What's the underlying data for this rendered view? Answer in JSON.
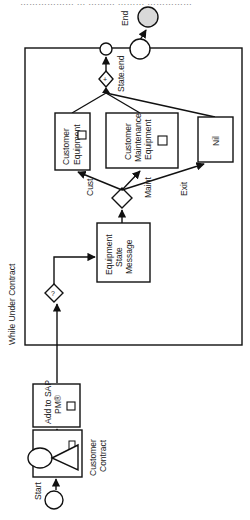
{
  "header_cut_text": "……………… … ……… ……… ……………",
  "loop": {
    "label": "While Under Contract"
  },
  "events": {
    "start": "Start",
    "end": "End",
    "state_end": "State.end"
  },
  "tasks": {
    "customer_contract": [
      "Customer",
      "Contract"
    ],
    "add_to_sap": [
      "Add to SAP",
      "PM®"
    ],
    "equipment_state_message": [
      "Equipment",
      "State",
      "Message"
    ],
    "customer_equipment": [
      "Customer",
      "Equipment"
    ],
    "customer_maintenance_equipment": [
      "Customer",
      "Maintenance",
      "Equipment"
    ],
    "nil": "Nil"
  },
  "gateways": {
    "loop_gateway": "?",
    "join_gateway": "+"
  },
  "flow_labels": {
    "cust": "Cust",
    "maint": "Maint",
    "exit": "Exit"
  },
  "colors": {
    "stroke": "#111111",
    "end_fill": "#d9d9d9",
    "background": "#ffffff"
  }
}
